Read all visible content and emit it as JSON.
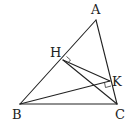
{
  "diagram": {
    "type": "geometry-triangle",
    "points": {
      "A": {
        "label": "A",
        "x": 96,
        "y": 20
      },
      "B": {
        "label": "B",
        "x": 20,
        "y": 104
      },
      "C": {
        "label": "C",
        "x": 117,
        "y": 104
      },
      "H": {
        "label": "H",
        "x": 63,
        "y": 60
      },
      "K": {
        "label": "K",
        "x": 110,
        "y": 81
      }
    },
    "segments": [
      [
        "A",
        "B"
      ],
      [
        "B",
        "C"
      ],
      [
        "C",
        "A"
      ],
      [
        "H",
        "C"
      ],
      [
        "H",
        "K"
      ],
      [
        "B",
        "K"
      ]
    ],
    "right_angles": [
      "H",
      "K"
    ],
    "colors": {
      "stroke": "#222222",
      "background": "#ffffff"
    }
  }
}
